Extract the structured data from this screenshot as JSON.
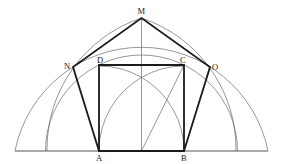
{
  "diagram": {
    "points": {
      "M": {
        "label": "M",
        "x": 141.5,
        "y": 18
      },
      "N": {
        "label": "N",
        "x": 73,
        "y": 67
      },
      "D": {
        "label": "D",
        "x": 99,
        "y": 65
      },
      "C": {
        "label": "C",
        "x": 184,
        "y": 65
      },
      "O": {
        "label": "O",
        "x": 210,
        "y": 67
      },
      "A": {
        "label": "A",
        "x": 99,
        "y": 151
      },
      "B": {
        "label": "B",
        "x": 184,
        "y": 151
      }
    },
    "labels": [
      "M",
      "N",
      "D",
      "C",
      "O",
      "A",
      "B"
    ],
    "colors": {
      "thick_line": "#1a1a1a",
      "thin_line": "#6a6a6a",
      "background": "#ffffff"
    }
  }
}
